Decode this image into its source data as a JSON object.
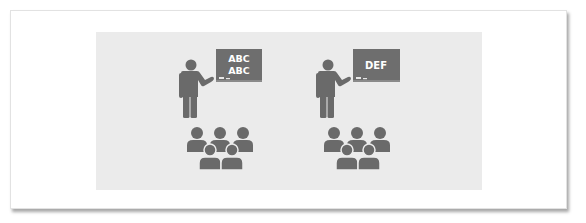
{
  "illustration": {
    "description": "Two classroom scenes side by side: a teacher pointing at a chalkboard above a group of five students",
    "colors": {
      "background": "#ffffff",
      "panel": "#ebebeb",
      "figure": "#6a6a6a",
      "board": "#6e6e6e",
      "board_text": "#ffffff",
      "frame_border": "#e2e2e2"
    },
    "scenes": [
      {
        "teacher_icon": "teacher-icon",
        "board": {
          "lines": [
            "ABC",
            "ABC"
          ]
        },
        "students_icon": "students-group-icon",
        "student_count": 5
      },
      {
        "teacher_icon": "teacher-icon",
        "board": {
          "lines": [
            "DEF"
          ]
        },
        "students_icon": "students-group-icon",
        "student_count": 5
      }
    ]
  }
}
